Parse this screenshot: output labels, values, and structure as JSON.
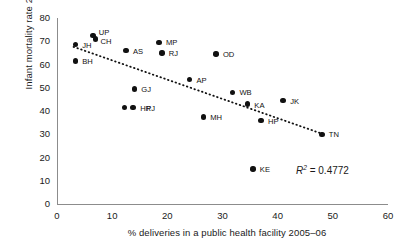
{
  "chart_data": {
    "type": "scatter",
    "title": "",
    "xlabel": "% deliveries in a public health facility 2005–06",
    "ylabel": "Infant mortality rate 2005–06",
    "xlim": [
      0,
      60
    ],
    "ylim": [
      0,
      80
    ],
    "xticks": [
      0,
      10,
      20,
      30,
      40,
      50,
      60
    ],
    "yticks": [
      0,
      10,
      20,
      30,
      40,
      50,
      60,
      70,
      80
    ],
    "grid": false,
    "legend": "none",
    "annotations": [
      {
        "name": "r-squared",
        "text_prefix": "R",
        "text_sup": "2",
        "text_suffix": " = 0.4772",
        "value": 0.4772
      }
    ],
    "trendline": {
      "style": "dotted",
      "color": "#111111",
      "x_start": 3.0,
      "y_start": 67.6,
      "x_end": 48.8,
      "y_end": 29.6
    },
    "points": [
      {
        "label": "JH",
        "x": 3.3,
        "y": 68.5,
        "lx": 7,
        "ly": -1
      },
      {
        "label": "BH",
        "x": 3.3,
        "y": 61.5,
        "lx": 7,
        "ly": -1
      },
      {
        "label": "UP",
        "x": 6.5,
        "y": 72.5,
        "lx": 6,
        "ly": -4
      },
      {
        "label": "CH",
        "x": 7.0,
        "y": 71.0,
        "lx": 5,
        "ly": 1
      },
      {
        "label": "AS",
        "x": 12.5,
        "y": 66.0,
        "lx": 7,
        "ly": -1
      },
      {
        "label": "MP",
        "x": 18.5,
        "y": 69.5,
        "lx": 7,
        "ly": -1
      },
      {
        "label": "RJ",
        "x": 19.0,
        "y": 65.0,
        "lx": 7,
        "ly": -1
      },
      {
        "label": "OD",
        "x": 28.8,
        "y": 64.5,
        "lx": 7,
        "ly": -1
      },
      {
        "label": "AP",
        "x": 24.0,
        "y": 53.5,
        "lx": 7,
        "ly": -1
      },
      {
        "label": "GJ",
        "x": 14.0,
        "y": 49.5,
        "lx": 7,
        "ly": -1
      },
      {
        "label": "PJ",
        "x": 12.2,
        "y": 41.5,
        "lx": 22,
        "ly": -1
      },
      {
        "label": "HR",
        "x": 13.8,
        "y": 41.5,
        "lx": 7,
        "ly": -1
      },
      {
        "label": "WB",
        "x": 31.8,
        "y": 48.0,
        "lx": 7,
        "ly": -1
      },
      {
        "label": "KA",
        "x": 34.5,
        "y": 43.0,
        "lx": 7,
        "ly": 0
      },
      {
        "label": "JK",
        "x": 41.0,
        "y": 44.5,
        "lx": 7,
        "ly": -1
      },
      {
        "label": "MH",
        "x": 26.5,
        "y": 37.5,
        "lx": 7,
        "ly": -1
      },
      {
        "label": "HP",
        "x": 37.0,
        "y": 36.0,
        "lx": 7,
        "ly": 0
      },
      {
        "label": "KE",
        "x": 35.5,
        "y": 15.0,
        "lx": 7,
        "ly": -1
      },
      {
        "label": "TN",
        "x": 48.0,
        "y": 30.0,
        "lx": 7,
        "ly": -1
      }
    ]
  }
}
